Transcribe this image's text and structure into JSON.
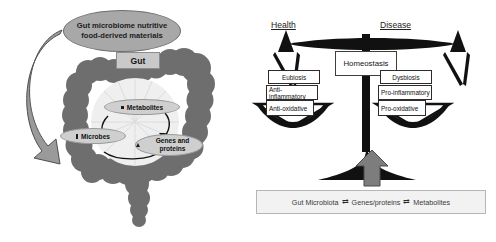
{
  "figure": {
    "colors": {
      "colon_fill": "#6e6e6e",
      "oval_fill": "#a8a8a8",
      "bubble_fill": "#cfcfcf",
      "scale_black": "#111111",
      "legend_bg": "#f2f2f2",
      "arrow_gray": "#808080"
    }
  },
  "left_panel": {
    "source_oval": "Gut microbiome nutritive food-derived materials",
    "gut_box": "Gut",
    "bubbles": [
      {
        "label": "Metabolites",
        "marker": "square"
      },
      {
        "label": "Microbes",
        "marker": "rod"
      },
      {
        "label": "Genes and proteins",
        "marker": "triangle"
      }
    ]
  },
  "right_panel": {
    "left_title": "Health",
    "right_title": "Disease",
    "fulcrum_label": "Homeostasis",
    "left_pan": {
      "title": "Eubiosis",
      "items": [
        "Anti-inflammatory",
        "Anti-oxidative"
      ]
    },
    "right_pan": {
      "title": "Dysbiosis",
      "items": [
        "Pro-inflammatory",
        "Pro-oxidative"
      ]
    },
    "legend": {
      "terms": [
        "Gut Microbiota",
        "Genes/proteins",
        "Metabolites"
      ],
      "connector": "⇄"
    }
  }
}
